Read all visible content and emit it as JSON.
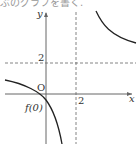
{
  "header": {
    "cropped_text": "ぶのグラフを書く."
  },
  "diagram": {
    "axes": {
      "x_label": "x",
      "y_label": "y",
      "origin_label": "O"
    },
    "asymptotes": {
      "vertical_x": "2",
      "horizontal_y": "2"
    },
    "labels": {
      "x_tick": "2",
      "y_tick": "2",
      "intercept": "f(0)"
    },
    "curve_color": "#222222",
    "axis_color": "#666666"
  }
}
